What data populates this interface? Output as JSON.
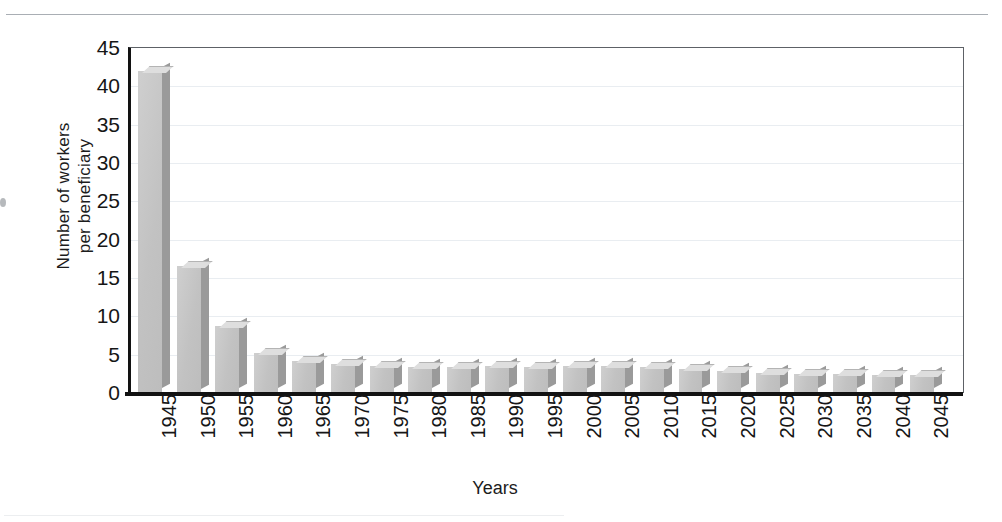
{
  "chart_data": {
    "type": "bar",
    "title": "",
    "xlabel": "Years",
    "ylabel": "Number of workers\nper beneficiary",
    "categories": [
      "1945",
      "1950",
      "1955",
      "1960",
      "1965",
      "1970",
      "1975",
      "1980",
      "1985",
      "1990",
      "1995",
      "2000",
      "2005",
      "2010",
      "2015",
      "2020",
      "2025",
      "2030",
      "2035",
      "2040",
      "2045"
    ],
    "values": [
      41.9,
      16.5,
      8.6,
      5.1,
      4.0,
      3.7,
      3.4,
      3.3,
      3.3,
      3.4,
      3.3,
      3.4,
      3.4,
      3.3,
      3.0,
      2.7,
      2.5,
      2.4,
      2.3,
      2.2,
      2.2
    ],
    "ylim": [
      0,
      45
    ],
    "yticks": [
      "0",
      "5",
      "10",
      "15",
      "20",
      "25",
      "30",
      "35",
      "40",
      "45"
    ],
    "ytick_values": [
      0,
      5,
      10,
      15,
      20,
      25,
      30,
      35,
      40,
      45
    ],
    "grid": "horizontal",
    "legend": "none",
    "style": "3d-column-chart-grayscale"
  },
  "colors": {
    "bar_front": "#c2c2c2",
    "bar_top": "#dedede",
    "bar_side": "#9a9a9a",
    "axis": "#121212",
    "grid": "#e9edf1",
    "text": "#161616",
    "page_rule": "#a9aeb4"
  }
}
